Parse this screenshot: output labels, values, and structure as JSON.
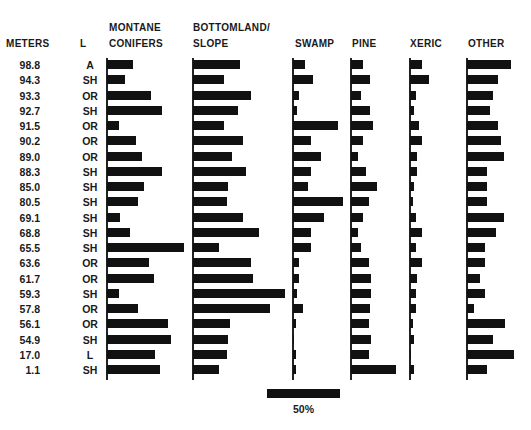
{
  "headers": {
    "meters": "METERS",
    "lithology": "L",
    "montane_1": "MONTANE",
    "montane_2": "CONIFERS",
    "bottomland_1": "BOTTOMLAND/",
    "bottomland_2": "SLOPE",
    "swamp": "SWAMP",
    "pine": "PINE",
    "xeric": "XERIC",
    "other": "OTHER"
  },
  "scale": {
    "label": "50%",
    "pixels_per_50pct": 73
  },
  "chart_data": {
    "type": "bar",
    "title": "",
    "xlabel": "Percent",
    "ylabel": "METERS",
    "orientation": "horizontal-multi-panel",
    "scale_bar": "50%",
    "categories": [
      "98.8",
      "94.3",
      "93.3",
      "92.7",
      "91.5",
      "90.2",
      "89.0",
      "88.3",
      "85.0",
      "80.5",
      "69.1",
      "68.8",
      "65.5",
      "63.6",
      "61.7",
      "59.3",
      "57.8",
      "56.1",
      "54.9",
      "17.0",
      "1.1"
    ],
    "lithology": [
      "A",
      "SH",
      "OR",
      "SH",
      "OR",
      "OR",
      "OR",
      "SH",
      "SH",
      "SH",
      "SH",
      "SH",
      "SH",
      "OR",
      "OR",
      "SH",
      "OR",
      "OR",
      "SH",
      "L",
      "SH"
    ],
    "series": [
      {
        "name": "MONTANE CONIFERS",
        "values": [
          18,
          12,
          30,
          38,
          8,
          20,
          24,
          38,
          25,
          21,
          9,
          16,
          53,
          29,
          32,
          8,
          21,
          42,
          44,
          33,
          36
        ]
      },
      {
        "name": "BOTTOMLAND/SLOPE",
        "values": [
          32,
          21,
          40,
          31,
          21,
          34,
          27,
          36,
          24,
          23,
          34,
          45,
          18,
          40,
          41,
          63,
          53,
          25,
          24,
          23,
          18
        ]
      },
      {
        "name": "SWAMP",
        "values": [
          8,
          14,
          4,
          3,
          31,
          12,
          19,
          12,
          10,
          34,
          21,
          12,
          12,
          4,
          4,
          3,
          7,
          2,
          1,
          2,
          2
        ]
      },
      {
        "name": "PINE",
        "values": [
          8,
          13,
          7,
          13,
          15,
          8,
          5,
          10,
          18,
          12,
          8,
          5,
          7,
          12,
          14,
          14,
          13,
          12,
          14,
          12,
          31
        ]
      },
      {
        "name": "XERIC",
        "values": [
          8,
          13,
          4,
          3,
          6,
          8,
          5,
          5,
          3,
          2,
          4,
          8,
          4,
          8,
          5,
          4,
          4,
          2,
          3,
          1,
          3
        ]
      },
      {
        "name": "OTHER",
        "values": [
          30,
          21,
          18,
          16,
          21,
          23,
          25,
          14,
          14,
          14,
          25,
          20,
          12,
          12,
          9,
          12,
          5,
          26,
          18,
          32,
          14
        ]
      }
    ]
  }
}
